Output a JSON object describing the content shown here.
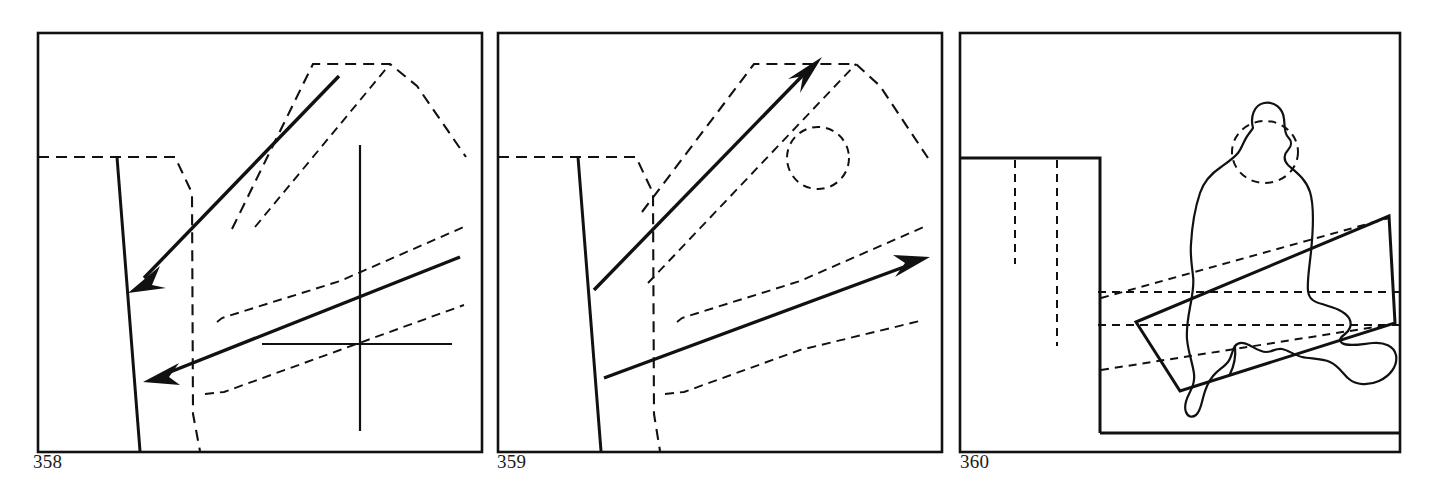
{
  "plate": {
    "width": 1429,
    "height": 493,
    "background": "#ffffff",
    "ink_color": "#111111",
    "kind": "architectural-analysis-diagram-plate",
    "panel_count": 3
  },
  "captions": [
    {
      "id": "caption-358",
      "text": "358",
      "x": 33,
      "y": 462
    },
    {
      "id": "caption-359",
      "text": "359",
      "x": 497,
      "y": 462
    },
    {
      "id": "caption-360",
      "text": "360",
      "x": 960,
      "y": 462
    }
  ],
  "panels": [
    {
      "id": "panel-358",
      "number": "358",
      "frame": {
        "x": 38,
        "y": 33,
        "w": 444,
        "h": 419
      },
      "description": "Site plan analysis: two heavy arrows pointing down-left across a dashed ridge outline, with a solid cross axis at right.",
      "solid_arrows": [
        {
          "name": "upper-arrow",
          "from": [
            339,
            76
          ],
          "to": [
            131,
            292
          ],
          "label": "long diagonal arrow pointing lower-left"
        },
        {
          "name": "lower-arrow",
          "from": [
            460,
            257
          ],
          "to": [
            146,
            381
          ],
          "label": "shallow diagonal arrow pointing lower-left"
        }
      ],
      "solid_lines": [
        {
          "name": "vertical-axis",
          "from": [
            360,
            145
          ],
          "to": [
            360,
            431
          ]
        },
        {
          "name": "horizontal-axis",
          "from": [
            262,
            344
          ],
          "to": [
            452,
            344
          ]
        },
        {
          "name": "building-edge",
          "from": [
            117,
            157
          ],
          "to": [
            140,
            451
          ]
        }
      ],
      "dashed_shapes": [
        {
          "name": "ridge-outline",
          "points": "38,157 175,157 176,157 192,193 193,414 200,451"
        },
        {
          "name": "roof-ridge-upper",
          "points": "232,229 313,64 390,64 392,62 417,86 466,157"
        },
        {
          "name": "roof-ridge-lower",
          "points": "255,227 390,64"
        },
        {
          "name": "terrace-upper",
          "points": "217,322 220,318 340,281 465,226"
        },
        {
          "name": "terrace-lower",
          "points": "205,394 223,392 340,350 464,305"
        }
      ]
    },
    {
      "id": "panel-359",
      "number": "359",
      "frame": {
        "x": 498,
        "y": 33,
        "w": 444,
        "h": 419
      },
      "description": "Same site plan with arrows reversed: two heavy arrows pointing up-right, plus a dashed circle node in the upper right.",
      "solid_arrows": [
        {
          "name": "upper-arrow",
          "from": [
            594,
            290
          ],
          "to": [
            819,
            60
          ],
          "label": "long diagonal arrow pointing upper-right"
        },
        {
          "name": "lower-arrow",
          "from": [
            604,
            378
          ],
          "to": [
            928,
            258
          ],
          "label": "shallow diagonal arrow pointing upper-right"
        }
      ],
      "solid_lines": [
        {
          "name": "building-edge",
          "from": [
            578,
            157
          ],
          "to": [
            601,
            451
          ]
        }
      ],
      "dashed_shapes": [
        {
          "name": "ridge-outline",
          "points": "498,157 636,157 637,157 653,193 654,414 660,451"
        },
        {
          "name": "roof-ridge-upper",
          "points": "642,212 754,64 856,64 858,62 880,86 928,158"
        },
        {
          "name": "roof-ridge-lower",
          "points": "648,283 856,64"
        },
        {
          "name": "terrace-upper",
          "points": "677,322 680,318 800,281 925,226"
        },
        {
          "name": "terrace-lower",
          "points": "665,394 683,392 800,350 924,320"
        },
        {
          "name": "node-circle",
          "cx": 818,
          "cy": 158,
          "r": 31
        }
      ]
    },
    {
      "id": "panel-360",
      "number": "360",
      "frame": {
        "x": 960,
        "y": 33,
        "w": 440,
        "h": 419
      },
      "description": "Section through the building: a tall solid block at left, a seated haloed figure at right sitting on an inclined plane with dashed sight lines.",
      "solid_lines": [
        {
          "name": "wall-block",
          "points": "960,158 1100,158 1100,433"
        },
        {
          "name": "base-line",
          "from": [
            1100,
            433
          ],
          "to": [
            1400,
            433
          ]
        }
      ],
      "dashed_shapes": [
        {
          "name": "hidden-joint-left",
          "from": [
            1015,
            158
          ],
          "to": [
            1015,
            263
          ]
        },
        {
          "name": "hidden-joint-right",
          "from": [
            1057,
            158
          ],
          "to": [
            1057,
            345
          ]
        },
        {
          "name": "eye-level-line",
          "from": [
            1098,
            292
          ],
          "to": [
            1400,
            292
          ]
        },
        {
          "name": "sill-level-line",
          "from": [
            1098,
            325
          ],
          "to": [
            1400,
            325
          ]
        },
        {
          "name": "plane-diagonal-upper",
          "from": [
            1100,
            297
          ],
          "to": [
            1389,
            218
          ]
        },
        {
          "name": "plane-diagonal-lower",
          "from": [
            1100,
            369
          ],
          "to": [
            1392,
            323
          ]
        }
      ],
      "plane": {
        "name": "inclined-seat-plane",
        "points": "1136,322 1389,216 1395,323 1180,391"
      },
      "figure": {
        "name": "seated-figure-silhouette",
        "halo": {
          "cx": 1265,
          "cy": 152,
          "rx": 33,
          "ry": 31
        }
      }
    }
  ]
}
